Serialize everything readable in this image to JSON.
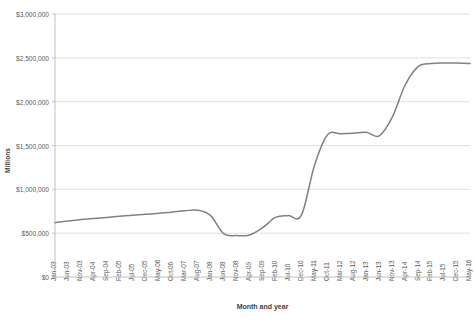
{
  "chart_data": {
    "type": "line",
    "title": "",
    "xlabel": "Month and year",
    "ylabel": "Millions",
    "grid": true,
    "legend": "none",
    "ylim": [
      0,
      3000000
    ],
    "ytick_labels": [
      "$0",
      "$500,000",
      "$1,000,000",
      "$1,500,000",
      "$2,000,000",
      "$2,500,000",
      "$3,000,000"
    ],
    "ytick_values": [
      0,
      500000,
      1000000,
      1500000,
      2000000,
      2500000,
      3000000
    ],
    "xtick_labels": [
      "Jan-03",
      "Jun-03",
      "Nov-03",
      "Apr-04",
      "Sep-04",
      "Feb-05",
      "Jul-05",
      "Dec-05",
      "May-06",
      "Oct-06",
      "Mar-07",
      "Aug-07",
      "Jan-08",
      "Jun-08",
      "Nov-08",
      "Apr-09",
      "Sep-09",
      "Feb-10",
      "Jul-10",
      "Dec-10",
      "May-11",
      "Oct-11",
      "Mar-12",
      "Aug-12",
      "Jan-13",
      "Jun-13",
      "Nov-13",
      "Apr-14",
      "Sep-14",
      "Feb-15",
      "Jul-15",
      "Dec-15",
      "May-16"
    ],
    "series": [
      {
        "name": "Value",
        "x": [
          "Jan-03",
          "Jun-03",
          "Nov-03",
          "Apr-04",
          "Sep-04",
          "Feb-05",
          "Jul-05",
          "Dec-05",
          "May-06",
          "Oct-06",
          "Mar-07",
          "Aug-07",
          "Jan-08",
          "Jun-08",
          "Nov-08",
          "Apr-09",
          "Sep-09",
          "Feb-10",
          "Jul-10",
          "Dec-10",
          "May-11",
          "Oct-11",
          "Mar-12",
          "Aug-12",
          "Jan-13",
          "Jun-13",
          "Nov-13",
          "Apr-14",
          "Sep-14",
          "Feb-15",
          "Jul-15",
          "Dec-15",
          "May-16"
        ],
        "values": [
          620000,
          640000,
          655000,
          668000,
          680000,
          692000,
          705000,
          715000,
          728000,
          740000,
          755000,
          762000,
          700000,
          495000,
          472000,
          480000,
          560000,
          680000,
          700000,
          705000,
          1270000,
          1620000,
          1635000,
          1640000,
          1650000,
          1610000,
          1820000,
          2190000,
          2400000,
          2435000,
          2440000,
          2440000,
          2435000
        ]
      }
    ]
  },
  "plot_geometry": {
    "left": 55,
    "right": 470,
    "top": 14,
    "bottom": 277
  },
  "line_color": "#808080",
  "grid_color": "#d3d3d3"
}
